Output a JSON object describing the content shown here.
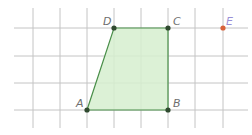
{
  "diagram": {
    "grid": {
      "vertical_x": [
        33,
        60,
        87,
        114,
        141,
        168,
        195,
        223
      ],
      "horizontal_y": [
        28,
        56,
        83,
        110
      ],
      "line_color": "#bdbdbd"
    },
    "polygon": {
      "name": "ABCD",
      "fill": "#d8f0d0",
      "stroke": "#3f8a3f",
      "vertices": [
        "A",
        "B",
        "C",
        "D"
      ]
    },
    "points": [
      {
        "label": "A",
        "x": 87,
        "y": 110,
        "color": "#2f4f2f"
      },
      {
        "label": "B",
        "x": 168,
        "y": 110,
        "color": "#2f4f2f"
      },
      {
        "label": "C",
        "x": 168,
        "y": 28,
        "color": "#2f4f2f"
      },
      {
        "label": "D",
        "x": 114,
        "y": 28,
        "color": "#2f4f2f"
      },
      {
        "label": "E",
        "x": 223,
        "y": 28,
        "color": "#d9623a"
      }
    ]
  }
}
